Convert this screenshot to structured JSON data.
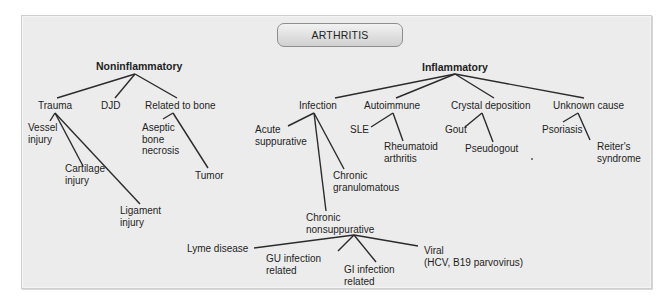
{
  "diagram": {
    "root": "ARTHRITIS",
    "branches": {
      "noninflammatory": {
        "label": "Noninflammatory",
        "children": {
          "trauma": {
            "label": "Trauma",
            "children": [
              "Vessel injury",
              "Cartilage injury",
              "Ligament injury"
            ]
          },
          "djd": {
            "label": "DJD"
          },
          "bone": {
            "label": "Related to bone",
            "children": [
              "Aseptic bone necrosis",
              "Tumor"
            ]
          }
        }
      },
      "inflammatory": {
        "label": "Inflammatory",
        "children": {
          "infection": {
            "label": "Infection",
            "children": {
              "acute": "Acute suppurative",
              "granulomatous": "Chronic granulomatous",
              "nonsuppurative": {
                "label": "Chronic nonsuppurative",
                "children": [
                  "Lyme disease",
                  "GU infection related",
                  "GI infection related",
                  "Viral (HCV, B19 parvovirus)"
                ]
              }
            }
          },
          "autoimmune": {
            "label": "Autoimmune",
            "children": [
              "SLE",
              "Rheumatoid arthritis"
            ]
          },
          "crystal": {
            "label": "Crystal deposition",
            "children": [
              "Gout",
              "Pseudogout"
            ]
          },
          "unknown": {
            "label": "Unknown cause",
            "children": [
              "Psoriasis",
              "Reiter's syndrome"
            ]
          }
        }
      }
    }
  },
  "labels": {
    "root": "ARTHRITIS",
    "noninflammatory": "Noninflammatory",
    "inflammatory": "Inflammatory",
    "trauma": "Trauma",
    "djd": "DJD",
    "related_to_bone": "Related to bone",
    "vessel_1": "Vessel",
    "vessel_2": "injury",
    "cartilage_1": "Cartilage",
    "cartilage_2": "injury",
    "ligament_1": "Ligament",
    "ligament_2": "injury",
    "aseptic_1": "Aseptic",
    "aseptic_2": "bone",
    "aseptic_3": "necrosis",
    "tumor": "Tumor",
    "infection": "Infection",
    "autoimmune": "Autoimmune",
    "crystal": "Crystal deposition",
    "unknown": "Unknown cause",
    "acute_1": "Acute",
    "acute_2": "suppurative",
    "granulomatous_1": "Chronic",
    "granulomatous_2": "granulomatous",
    "nonsupp_1": "Chronic",
    "nonsupp_2": "nonsuppurative",
    "sle": "SLE",
    "ra_1": "Rheumatoid",
    "ra_2": "arthritis",
    "gout": "Gout",
    "pseudogout": "Pseudogout",
    "psoriasis": "Psoriasis",
    "reiters_1": "Reiter's",
    "reiters_2": "syndrome",
    "lyme": "Lyme disease",
    "gu_1": "GU infection",
    "gu_2": "related",
    "gi_1": "GI infection",
    "gi_2": "related",
    "viral_1": "Viral",
    "viral_2": "(HCV, B19 parvovirus)"
  },
  "colors": {
    "panel_bg": "#ececec",
    "line": "#2b2b2b",
    "root_gradient_top": "#f2f2f2",
    "root_gradient_bottom": "#d0d0d0"
  }
}
